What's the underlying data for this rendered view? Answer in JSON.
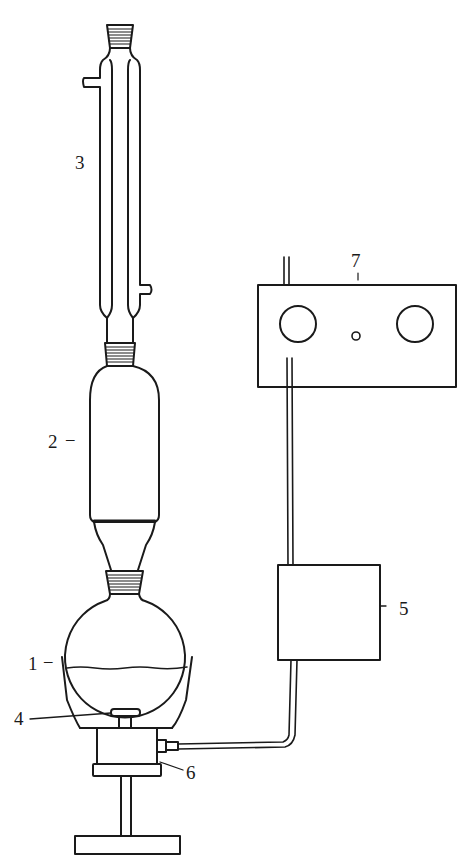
{
  "diagram": {
    "type": "laboratory-apparatus",
    "stroke_color": "#1a1a1a",
    "background": "#ffffff",
    "labels": [
      {
        "id": "1",
        "text": "1",
        "part": "round-bottom-flask"
      },
      {
        "id": "2",
        "text": "2",
        "part": "extraction-chamber"
      },
      {
        "id": "3",
        "text": "3",
        "part": "reflux-condenser"
      },
      {
        "id": "4",
        "text": "4",
        "part": "magnetic-stir-bar"
      },
      {
        "id": "5",
        "text": "5",
        "part": "controller-box"
      },
      {
        "id": "6",
        "text": "6",
        "part": "heater-stirrer-base"
      },
      {
        "id": "7",
        "text": "7",
        "part": "control-unit"
      }
    ]
  }
}
